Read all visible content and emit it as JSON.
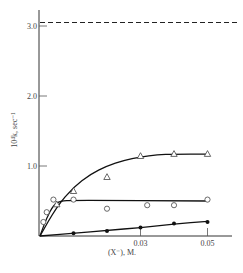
{
  "chart_data": {
    "type": "scatter",
    "title": "",
    "xlabel": "(X⁻), M.",
    "ylabel": "10⁴k, sec⁻¹",
    "xlim": [
      0,
      0.055
    ],
    "ylim": [
      0,
      3.2
    ],
    "x_ticks": [
      0.03,
      0.05
    ],
    "x_tick_labels": [
      "0.03",
      "0.05"
    ],
    "y_ticks": [
      1.0,
      2.0,
      3.0
    ],
    "y_tick_labels": [
      "1.0",
      "2.0",
      "3.0"
    ],
    "grid": false,
    "legend": null,
    "reference_lines": [
      {
        "style": "dashed",
        "orientation": "horizontal",
        "y": 3.05
      }
    ],
    "series": [
      {
        "name": "triangles",
        "marker": "open-triangle",
        "points": [
          [
            0.005,
            0.45
          ],
          [
            0.01,
            0.64
          ],
          [
            0.02,
            0.84
          ],
          [
            0.03,
            1.14
          ],
          [
            0.04,
            1.17
          ],
          [
            0.05,
            1.17
          ]
        ],
        "fit_curve": [
          [
            0,
            0
          ],
          [
            0.005,
            0.42
          ],
          [
            0.01,
            0.7
          ],
          [
            0.015,
            0.88
          ],
          [
            0.02,
            1.0
          ],
          [
            0.025,
            1.08
          ],
          [
            0.03,
            1.13
          ],
          [
            0.035,
            1.16
          ],
          [
            0.04,
            1.17
          ],
          [
            0.05,
            1.17
          ]
        ]
      },
      {
        "name": "open circles",
        "marker": "open-circle",
        "points": [
          [
            0.001,
            0.2
          ],
          [
            0.002,
            0.34
          ],
          [
            0.004,
            0.52
          ],
          [
            0.01,
            0.52
          ],
          [
            0.02,
            0.39
          ],
          [
            0.032,
            0.44
          ],
          [
            0.04,
            0.44
          ],
          [
            0.05,
            0.52
          ]
        ],
        "fit_curve": [
          [
            0,
            0
          ],
          [
            0.002,
            0.26
          ],
          [
            0.004,
            0.44
          ],
          [
            0.006,
            0.5
          ],
          [
            0.01,
            0.51
          ],
          [
            0.05,
            0.5
          ]
        ]
      },
      {
        "name": "filled circles",
        "marker": "filled-circle",
        "points": [
          [
            0.01,
            0.04
          ],
          [
            0.02,
            0.07
          ],
          [
            0.03,
            0.12
          ],
          [
            0.04,
            0.18
          ],
          [
            0.05,
            0.2
          ]
        ],
        "fit_curve": [
          [
            0,
            0
          ],
          [
            0.01,
            0.04
          ],
          [
            0.02,
            0.08
          ],
          [
            0.03,
            0.12
          ],
          [
            0.04,
            0.17
          ],
          [
            0.05,
            0.21
          ]
        ]
      }
    ]
  }
}
